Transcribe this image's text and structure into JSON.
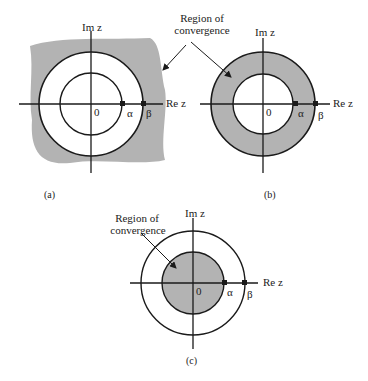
{
  "figure": {
    "shared_annotation": {
      "line1": "Region of",
      "line2": "convergence"
    },
    "panels": [
      {
        "id": "a",
        "caption": "(a)",
        "im_label": "Im z",
        "re_label": "Re z",
        "origin": "0",
        "pole1": "α",
        "pole2": "β",
        "roc": "|z| > |β| (exterior of outer circle)"
      },
      {
        "id": "b",
        "caption": "(b)",
        "im_label": "Im z",
        "re_label": "Re z",
        "origin": "0",
        "pole1": "α",
        "pole2": "β",
        "roc": "|α| < |z| < |β| (annulus)"
      },
      {
        "id": "c",
        "caption": "(c)",
        "im_label": "Im z",
        "re_label": "Re z",
        "origin": "0",
        "pole1": "α",
        "pole2": "β",
        "roc": "|z| < |α| (interior of inner circle)",
        "annotation": {
          "line1": "Region of",
          "line2": "convergence"
        }
      }
    ],
    "colors": {
      "shade": "#b3b3b3",
      "line": "#1a1a1a"
    }
  }
}
